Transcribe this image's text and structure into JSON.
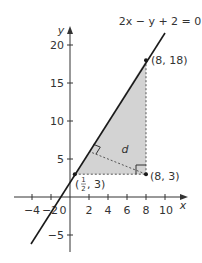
{
  "figure": {
    "equation": "2x − y + 2 = 0",
    "axis_x_label": "x",
    "axis_y_label": "y",
    "origin_label": "0",
    "x_ticks": [
      {
        "value": -4,
        "label": "−4"
      },
      {
        "value": -2,
        "label": "−2"
      },
      {
        "value": 2,
        "label": "2"
      },
      {
        "value": 4,
        "label": "4"
      },
      {
        "value": 6,
        "label": "6"
      },
      {
        "value": 8,
        "label": "8"
      },
      {
        "value": 10,
        "label": "10"
      }
    ],
    "y_ticks": [
      {
        "value": -5,
        "label": "−5"
      },
      {
        "value": 5,
        "label": "5"
      },
      {
        "value": 10,
        "label": "10"
      },
      {
        "value": 15,
        "label": "15"
      },
      {
        "value": 20,
        "label": "20"
      }
    ],
    "points": {
      "top": {
        "label": "(8, 18)",
        "x": 8,
        "y": 18
      },
      "left": {
        "label_prefix": "(",
        "frac_num": "1",
        "frac_den": "2",
        "label_suffix": ", 3)",
        "x": 0.5,
        "y": 3
      },
      "right": {
        "label": "(8, 3)",
        "x": 8,
        "y": 3
      }
    },
    "distance_label": "d",
    "colors": {
      "line": "#1a1a1a",
      "shade": "#d3d3d3",
      "dashed": "#555555",
      "axis": "#333333"
    }
  }
}
